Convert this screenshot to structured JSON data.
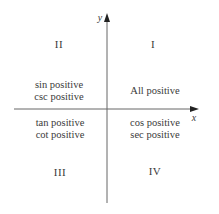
{
  "diagram": {
    "axes": {
      "x_label": "x",
      "y_label": "y",
      "color": "#555555"
    },
    "quadrants": [
      {
        "id": "I",
        "numeral": "I",
        "lines": [
          "All positive"
        ]
      },
      {
        "id": "II",
        "numeral": "II",
        "lines": [
          "sin positive",
          "csc positive"
        ]
      },
      {
        "id": "III",
        "numeral": "III",
        "lines": [
          "tan positive",
          "cot positive"
        ]
      },
      {
        "id": "IV",
        "numeral": "IV",
        "lines": [
          "cos positive",
          "sec positive"
        ]
      }
    ]
  }
}
